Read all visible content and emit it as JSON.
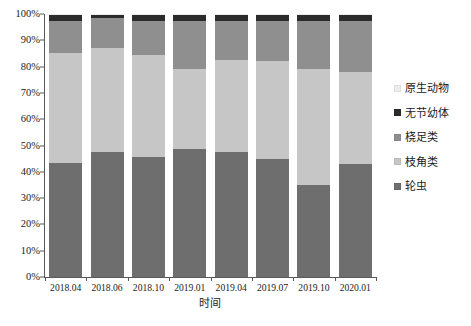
{
  "chart_data": {
    "type": "bar",
    "stacked": true,
    "normalized_percent": true,
    "title": "",
    "xlabel": "时间",
    "ylabel": "",
    "ylim": [
      0,
      100
    ],
    "ytick_labels": [
      "0%",
      "10%",
      "20%",
      "30%",
      "40%",
      "50%",
      "60%",
      "70%",
      "80%",
      "90%",
      "100%"
    ],
    "ytick_values": [
      0,
      10,
      20,
      30,
      40,
      50,
      60,
      70,
      80,
      90,
      100
    ],
    "grid": false,
    "legend_position": "right",
    "categories": [
      "2018.04",
      "2018.06",
      "2018.10",
      "2019.01",
      "2019.04",
      "2019.07",
      "2019.10",
      "2020.01"
    ],
    "stack_order_bottom_to_top": [
      "轮虫",
      "枝角类",
      "桡足类",
      "无节幼体",
      "原生动物"
    ],
    "series": [
      {
        "name": "轮虫",
        "color": "#6e6e6e",
        "values": [
          43.5,
          47.5,
          45.5,
          48.5,
          47.5,
          45.0,
          35.0,
          43.0
        ]
      },
      {
        "name": "枝角类",
        "color": "#c6c6c6",
        "values": [
          41.5,
          39.5,
          39.0,
          30.5,
          35.0,
          37.0,
          44.0,
          35.0
        ]
      },
      {
        "name": "桡足类",
        "color": "#8f8f8f",
        "values": [
          12.5,
          11.5,
          13.0,
          18.5,
          15.0,
          15.5,
          18.5,
          19.5
        ]
      },
      {
        "name": "无节幼体",
        "color": "#2b2b2b",
        "values": [
          2.0,
          1.0,
          2.0,
          2.0,
          2.0,
          2.0,
          2.0,
          2.0
        ]
      },
      {
        "name": "原生动物",
        "color": "#ededed",
        "values": [
          0.5,
          0.5,
          0.5,
          0.5,
          0.5,
          0.5,
          0.5,
          0.5
        ]
      }
    ],
    "legend_entries": [
      {
        "label": "原生动物",
        "color": "#ededed"
      },
      {
        "label": "无节幼体",
        "color": "#2b2b2b"
      },
      {
        "label": "桡足类",
        "color": "#8f8f8f"
      },
      {
        "label": "枝角类",
        "color": "#c6c6c6"
      },
      {
        "label": "轮虫",
        "color": "#6e6e6e"
      }
    ]
  },
  "axis": {
    "x_title": "时间"
  }
}
